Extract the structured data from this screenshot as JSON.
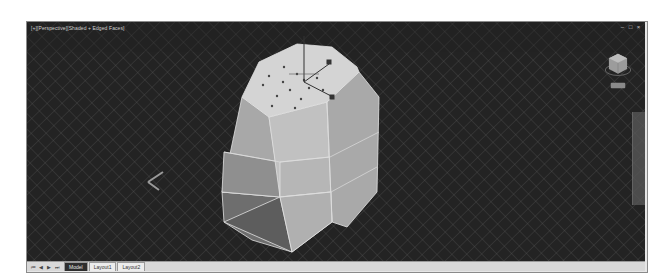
{
  "viewport": {
    "label": "[+][Perspective][Shaded + Edged Faces]",
    "background_color": "#232323",
    "grid_color": "#5e5e5e",
    "object_color": "#b9b9b9",
    "window_controls": [
      {
        "name": "minimize",
        "glyph": "–"
      },
      {
        "name": "restore",
        "glyph": "□"
      },
      {
        "name": "close",
        "glyph": "×"
      }
    ]
  },
  "viewcube": {
    "icon": "viewcube-icon",
    "home_button": "nav-home-button"
  },
  "ucs_icon": "ucs-axis-icon",
  "gizmo": "move-gizmo-icon",
  "bottombar": {
    "nav_arrows": [
      "⏮",
      "◀",
      "▶",
      "⏭"
    ],
    "tabs": [
      {
        "label": "Model",
        "active": true
      },
      {
        "label": "Layout1",
        "active": false
      },
      {
        "label": "Layout2",
        "active": false
      }
    ]
  }
}
